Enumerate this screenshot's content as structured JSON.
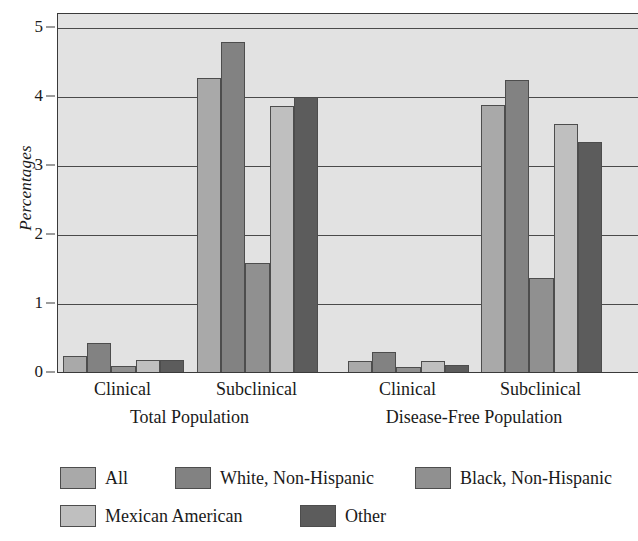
{
  "chart_data": {
    "type": "bar",
    "title": "",
    "subtitle": "",
    "xlabel": "",
    "ylabel": "Percentages",
    "ylim": [
      0,
      5.2
    ],
    "yticks": [
      0,
      1,
      2,
      3,
      4,
      5
    ],
    "ytick_labels": [
      "0",
      "1",
      "2",
      "3",
      "4",
      "5"
    ],
    "grid": true,
    "grid_axis": "y",
    "legend_position": "bottom",
    "orientation": "vertical",
    "plot_background": "#e2e2e2",
    "categories": [
      "Clinical",
      "Subclinical",
      "Clinical",
      "Subclinical"
    ],
    "group_panels": [
      {
        "label": "Total Population",
        "categories": [
          "Clinical",
          "Subclinical"
        ]
      },
      {
        "label": "Disease-Free Population",
        "categories": [
          "Clinical",
          "Subclinical"
        ]
      }
    ],
    "series": [
      {
        "name": "All",
        "color": "#a9a9a9",
        "values": [
          0.25,
          4.27,
          0.17,
          3.88
        ]
      },
      {
        "name": "White, Non-Hispanic",
        "color": "#828282",
        "values": [
          0.43,
          4.8,
          0.3,
          4.25
        ]
      },
      {
        "name": "Black, Non-Hispanic",
        "color": "#909090",
        "values": [
          0.1,
          1.59,
          0.08,
          1.38
        ]
      },
      {
        "name": "Mexican American",
        "color": "#bfbfbf",
        "values": [
          0.19,
          3.87,
          0.18,
          3.6
        ]
      },
      {
        "name": "Other",
        "color": "#5c5c5c",
        "values": [
          0.19,
          4.0,
          0.11,
          3.35
        ]
      }
    ]
  },
  "axis": {
    "y_title": "Percentages",
    "y_tick_labels": [
      "0",
      "1",
      "2",
      "3",
      "4",
      "5"
    ]
  },
  "group_labels": [
    "Clinical",
    "Subclinical",
    "Clinical",
    "Subclinical"
  ],
  "panel_labels": [
    "Total Population",
    "Disease-Free Population"
  ],
  "legend": {
    "items": [
      {
        "label": "All",
        "color": "#a9a9a9"
      },
      {
        "label": "White, Non-Hispanic",
        "color": "#828282"
      },
      {
        "label": "Black, Non-Hispanic",
        "color": "#909090"
      },
      {
        "label": "Mexican American",
        "color": "#bfbfbf"
      },
      {
        "label": "Other",
        "color": "#5c5c5c"
      }
    ]
  }
}
